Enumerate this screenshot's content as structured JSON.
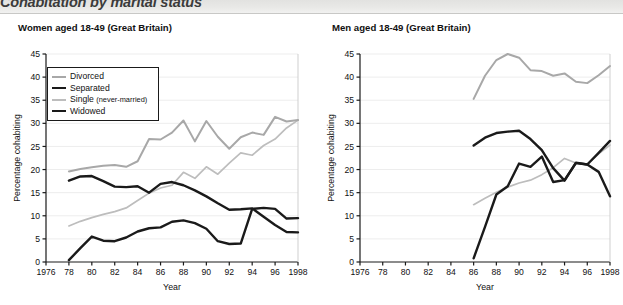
{
  "banner": {
    "title": "Cohabitation by marital status"
  },
  "charts": [
    {
      "key": "women",
      "panel_title": "Women aged 18-49 (Great Britain)",
      "ylabel": "Percentage cohabiting",
      "xlabel": "Year"
    },
    {
      "key": "men",
      "panel_title": "Men aged 18-49 (Great Britain)",
      "ylabel": "Percentage cohabiting",
      "xlabel": "Year"
    }
  ],
  "legend": {
    "items": [
      {
        "label": "Divorced",
        "sub": "",
        "color": "#a8a8a8",
        "width": 2.0
      },
      {
        "label": "Separated",
        "sub": "",
        "color": "#1a1a1a",
        "width": 2.4
      },
      {
        "label": "Single ",
        "sub": "(never-married)",
        "color": "#bdbdbd",
        "width": 1.7
      },
      {
        "label": "Widowed",
        "sub": "",
        "color": "#1a1a1a",
        "width": 2.4
      }
    ]
  },
  "chart_data": [
    {
      "type": "line",
      "title": "Women aged 18-49 (Great Britain)",
      "xlabel": "Year",
      "ylabel": "Percentage cohabiting",
      "xlim": [
        1976,
        1998
      ],
      "ylim": [
        0,
        45
      ],
      "ytick_step": 5,
      "xtick_step": 2,
      "xticks": [
        1976,
        1978,
        1980,
        1982,
        1984,
        1986,
        1988,
        1990,
        1992,
        1994,
        1996,
        1998
      ],
      "xticklabels": [
        "1976",
        "78",
        "80",
        "82",
        "84",
        "86",
        "88",
        "90",
        "92",
        "94",
        "96",
        "1998"
      ],
      "yticks": [
        0,
        5,
        10,
        15,
        20,
        25,
        30,
        35,
        40,
        45
      ],
      "grid": "horizontal",
      "legend_position": "upper left",
      "series": [
        {
          "name": "Divorced",
          "color": "#a8a8a8",
          "width": 2.0,
          "x": [
            1978,
            1979,
            1980,
            1981,
            1982,
            1983,
            1984,
            1985,
            1986,
            1987,
            1988,
            1989,
            1990,
            1991,
            1992,
            1993,
            1994,
            1995,
            1996,
            1997,
            1998
          ],
          "values": [
            19.6,
            20.1,
            20.5,
            20.8,
            21.0,
            20.6,
            21.8,
            26.6,
            26.5,
            28.0,
            30.6,
            26.1,
            30.5,
            27.1,
            24.5,
            27.0,
            28.0,
            27.5,
            31.4,
            30.4,
            30.7
          ]
        },
        {
          "name": "Separated",
          "color": "#1a1a1a",
          "width": 2.4,
          "x": [
            1978,
            1979,
            1980,
            1981,
            1982,
            1983,
            1984,
            1985,
            1986,
            1987,
            1988,
            1989,
            1990,
            1991,
            1992,
            1993,
            1994,
            1995,
            1996,
            1997,
            1998
          ],
          "values": [
            17.6,
            18.5,
            18.6,
            17.5,
            16.3,
            16.2,
            16.4,
            15.0,
            16.9,
            17.3,
            16.6,
            15.5,
            14.2,
            12.7,
            11.3,
            11.4,
            11.6,
            9.8,
            8.0,
            6.5,
            6.4
          ]
        },
        {
          "name": "Single (never-married)",
          "color": "#bdbdbd",
          "width": 1.7,
          "x": [
            1978,
            1979,
            1980,
            1981,
            1982,
            1983,
            1984,
            1985,
            1986,
            1987,
            1988,
            1989,
            1990,
            1991,
            1992,
            1993,
            1994,
            1995,
            1996,
            1997,
            1998
          ],
          "values": [
            7.8,
            8.8,
            9.6,
            10.3,
            10.9,
            11.7,
            13.3,
            14.9,
            16.0,
            16.6,
            19.4,
            18.1,
            20.6,
            19.0,
            21.4,
            23.6,
            23.1,
            25.2,
            26.6,
            29.0,
            30.7
          ]
        },
        {
          "name": "Widowed",
          "color": "#1a1a1a",
          "width": 2.4,
          "x": [
            1978,
            1979,
            1980,
            1981,
            1982,
            1983,
            1984,
            1985,
            1986,
            1987,
            1988,
            1989,
            1990,
            1991,
            1992,
            1993,
            1994,
            1995,
            1996,
            1997,
            1998
          ],
          "values": [
            0.4,
            3.0,
            5.5,
            4.6,
            4.5,
            5.3,
            6.6,
            7.3,
            7.5,
            8.7,
            9.0,
            8.4,
            7.2,
            4.5,
            3.9,
            4.0,
            11.5,
            11.7,
            11.5,
            9.4,
            9.5
          ]
        }
      ]
    },
    {
      "type": "line",
      "title": "Men aged 18-49 (Great Britain)",
      "xlabel": "Year",
      "ylabel": "Percentage cohabiting",
      "xlim": [
        1976,
        1998
      ],
      "ylim": [
        0,
        45
      ],
      "ytick_step": 5,
      "xtick_step": 2,
      "xticks": [
        1976,
        1978,
        1980,
        1982,
        1984,
        1986,
        1988,
        1990,
        1992,
        1994,
        1996,
        1998
      ],
      "xticklabels": [
        "1976",
        "78",
        "80",
        "82",
        "84",
        "86",
        "88",
        "90",
        "92",
        "94",
        "96",
        "1998"
      ],
      "yticks": [
        0,
        5,
        10,
        15,
        20,
        25,
        30,
        35,
        40,
        45
      ],
      "grid": "horizontal",
      "legend_position": "upper left",
      "series": [
        {
          "name": "Divorced",
          "color": "#a8a8a8",
          "width": 2.0,
          "x": [
            1986,
            1987,
            1988,
            1989,
            1990,
            1991,
            1992,
            1993,
            1994,
            1995,
            1996,
            1997,
            1998
          ],
          "values": [
            35.3,
            40.3,
            43.7,
            45.0,
            44.2,
            41.5,
            41.3,
            40.3,
            40.8,
            39.0,
            38.7,
            40.4,
            42.4
          ]
        },
        {
          "name": "Separated",
          "color": "#1a1a1a",
          "width": 2.4,
          "x": [
            1986,
            1987,
            1988,
            1989,
            1990,
            1991,
            1992,
            1993,
            1994,
            1995,
            1996,
            1997,
            1998
          ],
          "values": [
            25.2,
            26.9,
            27.9,
            28.2,
            28.4,
            26.6,
            24.2,
            20.3,
            17.6,
            21.5,
            21.1,
            23.6,
            26.2
          ]
        },
        {
          "name": "Single (never-married)",
          "color": "#bdbdbd",
          "width": 1.7,
          "x": [
            1986,
            1987,
            1988,
            1989,
            1990,
            1991,
            1992,
            1993,
            1994,
            1995,
            1996,
            1997,
            1998
          ],
          "values": [
            12.4,
            13.8,
            15.1,
            16.2,
            17.1,
            17.7,
            18.9,
            20.4,
            22.4,
            21.4,
            21.2,
            23.4,
            25.3
          ]
        },
        {
          "name": "Widowed",
          "color": "#1a1a1a",
          "width": 2.4,
          "x": [
            1986,
            1987,
            1988,
            1989,
            1990,
            1991,
            1992,
            1993,
            1994,
            1995,
            1996,
            1997,
            1998
          ],
          "values": [
            0.8,
            7.6,
            14.6,
            16.4,
            21.3,
            20.6,
            22.8,
            17.3,
            17.7,
            21.4,
            21.1,
            19.5,
            14.2
          ]
        }
      ]
    }
  ]
}
